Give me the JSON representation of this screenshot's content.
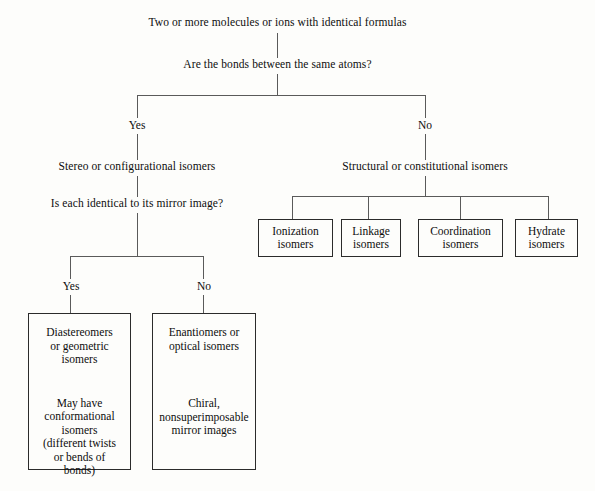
{
  "diagram": {
    "root": "Two or more molecules or ions with identical formulas",
    "question_1": "Are the bonds between the same atoms?",
    "branch_yes_1": "Yes",
    "branch_no_1": "No",
    "left_branch": {
      "heading": "Stereo or configurational isomers",
      "question": "Is each identical to its mirror image?",
      "branch_yes": "Yes",
      "branch_no": "No",
      "box_yes": {
        "primary": "Diastereomers\nor geometric\nisomers",
        "secondary": "May have\nconformational\nisomers\n(different twists\nor bends of\nbonds)"
      },
      "box_no": {
        "primary": "Enantiomers or\noptical isomers",
        "secondary": "Chiral,\nnonsuperimposable\nmirror images"
      }
    },
    "right_branch": {
      "heading": "Structural or constitutional isomers",
      "boxes": [
        {
          "label": "Ionization\nisomers"
        },
        {
          "label": "Linkage\nisomers"
        },
        {
          "label": "Coordination\nisomers"
        },
        {
          "label": "Hydrate\nisomers"
        }
      ]
    }
  },
  "colors": {
    "background": "#fdfdfb",
    "line": "#5a5a5a",
    "box_border": "#2b2b2b",
    "text": "#0d0d0d"
  }
}
